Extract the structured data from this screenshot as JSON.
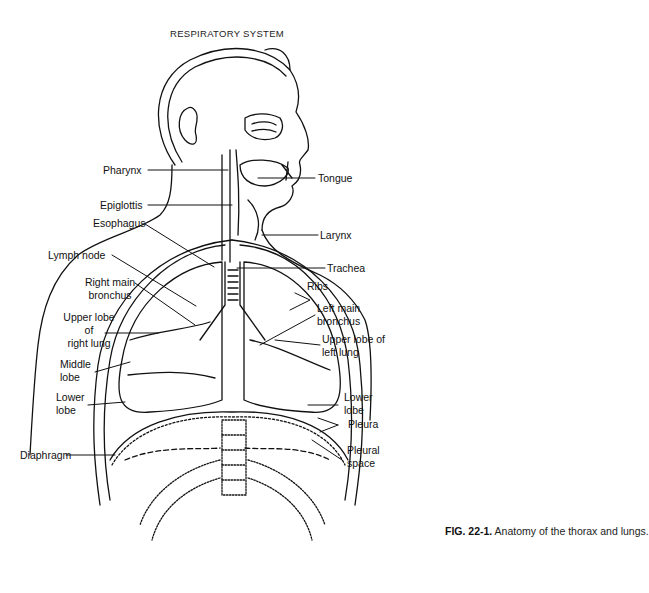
{
  "diagram": {
    "title": "RESPIRATORY SYSTEM",
    "labels": {
      "pharynx": "Pharynx",
      "tongue": "Tongue",
      "epiglottis": "Epiglottis",
      "esophagus": "Esophagus",
      "larynx": "Larynx",
      "lymph_node": "Lymph node",
      "trachea": "Trachea",
      "ribs": "Ribs",
      "right_main_bronchus_1": "Right main",
      "right_main_bronchus_2": "bronchus",
      "left_main_bronchus_1": "Left main",
      "left_main_bronchus_2": "bronchus",
      "upper_lobe_right_1": "Upper lobe",
      "upper_lobe_right_2": "of",
      "upper_lobe_right_3": "right lung",
      "upper_lobe_left_1": "Upper lobe of",
      "upper_lobe_left_2": "left lung",
      "middle_lobe_1": "Middle",
      "middle_lobe_2": "lobe",
      "lower_lobe_right_1": "Lower",
      "lower_lobe_right_2": "lobe",
      "lower_lobe_left_1": "Lower",
      "lower_lobe_left_2": "lobe",
      "pleura": "Pleura",
      "pleural_space_1": "Pleural",
      "pleural_space_2": "space",
      "diaphragm": "Diaphragm"
    },
    "caption": {
      "figure_number": "FIG. 22-1.",
      "text": "Anatomy of the thorax and lungs."
    }
  }
}
